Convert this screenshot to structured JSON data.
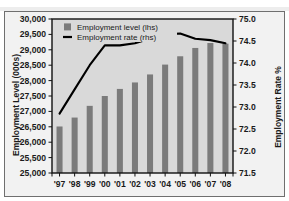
{
  "figure": {
    "clipped_header_text": "",
    "background_color": "#ffffff",
    "plot_background_color": "#d9d9d9",
    "frame_color": "#6f6f6f"
  },
  "chart_data": {
    "type": "bar",
    "title": "",
    "subtitle": "",
    "xlabel": "",
    "ylabel": "Employment Level (000s)",
    "y2label": "Employment Rate %",
    "categories": [
      "'97",
      "'98",
      "'99",
      "'00",
      "'01",
      "'02",
      "'03",
      "'04",
      "'05",
      "'06",
      "'07",
      "'08"
    ],
    "ylim": [
      25000,
      30000
    ],
    "ytick_step": 500,
    "yticks": [
      "25,000",
      "25,500",
      "26,000",
      "26,500",
      "27,000",
      "27,500",
      "28,000",
      "28,500",
      "29,000",
      "29,500",
      "30,000"
    ],
    "y2lim": [
      71.5,
      75.0
    ],
    "y2tick_step": 0.5,
    "y2ticks": [
      "71.5",
      "72.0",
      "72.5",
      "73.0",
      "73.5",
      "74.0",
      "74.5",
      "75.0"
    ],
    "grid": false,
    "legend_position": "top-left-inside",
    "series": [
      {
        "name": "Employment level (lhs)",
        "type": "bar",
        "axis": "left",
        "color": "#7b7b7b",
        "values": [
          26510,
          26800,
          27180,
          27500,
          27730,
          27940,
          28200,
          28520,
          28790,
          29060,
          29220,
          29200
        ]
      },
      {
        "name": "Employment rate (rhs)",
        "type": "line",
        "axis": "right",
        "color": "#000000",
        "values": [
          72.85,
          73.4,
          73.95,
          74.4,
          74.4,
          74.45,
          74.55,
          74.65,
          74.67,
          74.55,
          74.52,
          74.45
        ]
      }
    ]
  },
  "legend": {
    "items": [
      {
        "label": "Employment level (lhs)",
        "marker": "square",
        "color": "#7b7b7b"
      },
      {
        "label": "Employment rate (rhs)",
        "marker": "line",
        "color": "#000000"
      }
    ]
  }
}
